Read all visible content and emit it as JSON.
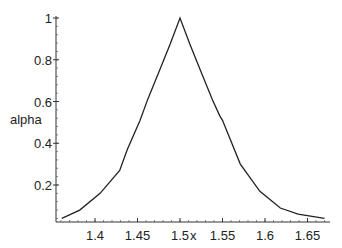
{
  "chart_data": {
    "type": "line",
    "title": "",
    "xlabel": "x",
    "ylabel": "alpha",
    "xlim": [
      1.355,
      1.675
    ],
    "ylim": [
      0.02,
      1.0
    ],
    "grid": false,
    "legend": null,
    "x_ticks": [
      "1.4",
      "1.45",
      "1.5",
      "1.55",
      "1.6",
      "1.65"
    ],
    "y_ticks": [
      "0.2",
      "0.4",
      "0.6",
      "0.8",
      "1"
    ],
    "series": [
      {
        "name": "alpha",
        "color": "#222222",
        "x": [
          1.361,
          1.382,
          1.406,
          1.429,
          1.438,
          1.453,
          1.462,
          1.475,
          1.488,
          1.5,
          1.512,
          1.525,
          1.538,
          1.547,
          1.55,
          1.571,
          1.594,
          1.618,
          1.639,
          1.67
        ],
        "values": [
          0.04,
          0.08,
          0.16,
          0.27,
          0.37,
          0.51,
          0.61,
          0.74,
          0.87,
          1.0,
          0.87,
          0.74,
          0.61,
          0.53,
          0.51,
          0.3,
          0.17,
          0.09,
          0.06,
          0.04
        ]
      }
    ]
  }
}
